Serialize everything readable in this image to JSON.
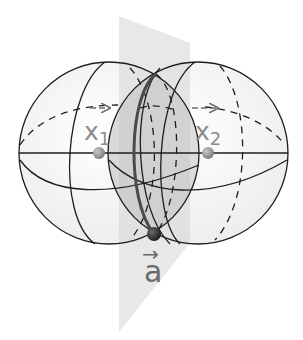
{
  "diagram": {
    "labels": {
      "x1_base": "x",
      "x1_sub": "1",
      "x2_base": "x",
      "x2_sub": "2",
      "a_arrow": "→",
      "a": "a"
    },
    "points": [
      {
        "name": "x1",
        "x": 99,
        "y": 153
      },
      {
        "name": "x2",
        "x": 208,
        "y": 153
      },
      {
        "name": "a",
        "x": 154,
        "y": 234
      }
    ],
    "colors": {
      "sphere_outline": "#1e1e1e",
      "plane_fill": "#d9d9d9",
      "lens_fill": "#bdbdbd",
      "intersection_circle": "#4a4a4a",
      "point_fill": "#8f8f8f",
      "point_a_fill": "#2e2e2e",
      "label_color": "#8c8c8c",
      "arrow_color": "#6e6e6e"
    }
  }
}
